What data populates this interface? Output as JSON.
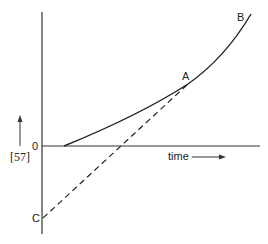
{
  "diagram": {
    "y_axis_label": "[57]",
    "x_axis_label": "time",
    "origin_label": "0",
    "points": {
      "A": "A",
      "B": "B",
      "C": "C"
    },
    "curves": [
      {
        "name": "solid-curve",
        "style": "solid",
        "from": "origin-offset",
        "through": "A",
        "to": "B"
      },
      {
        "name": "tangent-line",
        "style": "dashed",
        "from": "C",
        "to": "A"
      }
    ],
    "colors": {
      "ink": "#222222",
      "background": "#ffffff"
    }
  }
}
